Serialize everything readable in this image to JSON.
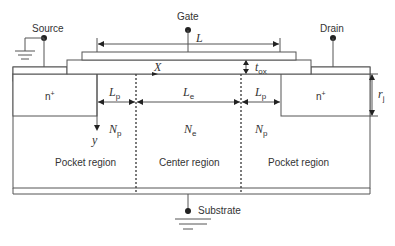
{
  "diagram": {
    "type": "MOSFET cross-section with halo/pocket implants",
    "terminals": {
      "source": "Source",
      "gate": "Gate",
      "drain": "Drain",
      "substrate": "Substrate"
    },
    "dimensions": {
      "gate_length": "L",
      "oxide_thickness": "t",
      "oxide_thickness_sub": "ox",
      "junction_depth": "r",
      "junction_depth_sub": "j",
      "pocket_length_left": "L",
      "pocket_length_left_sub": "p",
      "center_length": "L",
      "center_length_sub": "e",
      "pocket_length_right": "L",
      "pocket_length_right_sub": "p"
    },
    "axes": {
      "x": "X",
      "y": "y"
    },
    "doping": {
      "pocket_left": "N",
      "pocket_left_sub": "p",
      "center": "N",
      "center_sub": "e",
      "pocket_right": "N",
      "pocket_right_sub": "p"
    },
    "source_region": "n",
    "source_region_sup": "+",
    "drain_region": "n",
    "drain_region_sup": "+",
    "regions": {
      "left": "Pocket region",
      "center": "Center region",
      "right": "Pocket region"
    }
  }
}
